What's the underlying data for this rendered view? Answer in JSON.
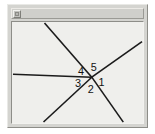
{
  "window": {
    "title": "",
    "system_menu_icon": "window-box-icon",
    "frame_color": "#d4d4d0",
    "canvas_color": "#efefec",
    "line_color": "#1b1b1b",
    "label_color": "#121212"
  },
  "figure": {
    "type": "geometry-angle-diagram",
    "vertex": {
      "x": 81,
      "y": 59
    },
    "rays": [
      {
        "name": "ray-up-left-steep",
        "from": {
          "x": 81,
          "y": 59
        },
        "to": {
          "x": 33,
          "y": 1
        }
      },
      {
        "name": "ray-up-right",
        "from": {
          "x": 81,
          "y": 59
        },
        "to": {
          "x": 132,
          "y": 21
        }
      },
      {
        "name": "ray-left-horizontal",
        "from": {
          "x": 81,
          "y": 59
        },
        "to": {
          "x": 1,
          "y": 56
        }
      },
      {
        "name": "ray-down-left",
        "from": {
          "x": 81,
          "y": 59
        },
        "to": {
          "x": 32,
          "y": 107
        }
      },
      {
        "name": "ray-down-right",
        "from": {
          "x": 81,
          "y": 59
        },
        "to": {
          "x": 113,
          "y": 107
        }
      }
    ],
    "labels": [
      {
        "id": "1",
        "text": "1",
        "x": 91,
        "y": 66
      },
      {
        "id": "2",
        "text": "2",
        "x": 80,
        "y": 73
      },
      {
        "id": "3",
        "text": "3",
        "x": 67,
        "y": 67
      },
      {
        "id": "4",
        "text": "4",
        "x": 70,
        "y": 54
      },
      {
        "id": "5",
        "text": "5",
        "x": 83,
        "y": 50
      }
    ]
  }
}
